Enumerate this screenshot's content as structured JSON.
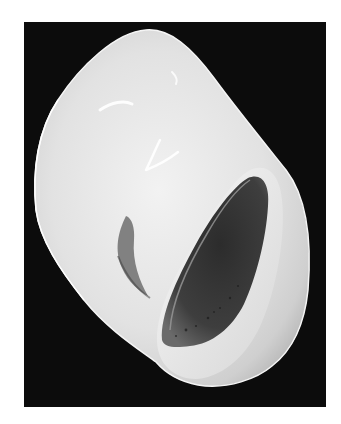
{
  "image": {
    "subject": "gastropod shell, apertural view",
    "style": "grayscale scanning electron micrograph",
    "background_color": "#0c0c0c",
    "border_color": "#ffffff",
    "shell_color": "#e6e6e6",
    "aperture_color": "#3a3a3a"
  }
}
